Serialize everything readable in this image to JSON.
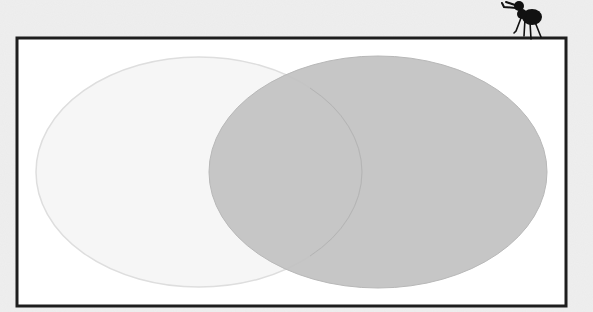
{
  "diagram": {
    "type": "venn",
    "background_color": "#efefef",
    "frame": {
      "x": 17,
      "y": 38,
      "width": 549,
      "height": 268,
      "stroke": "#1e1e1e",
      "stroke_width": 3,
      "fill": "#ffffff"
    },
    "sets": [
      {
        "id": "left",
        "cx": 199,
        "cy": 172,
        "rx": 163,
        "ry": 115,
        "fill": "#f6f6f6",
        "stroke": "#dedede",
        "opacity": 1
      },
      {
        "id": "right",
        "cx": 378,
        "cy": 172,
        "rx": 169,
        "ry": 116,
        "fill": "#c2c2c2",
        "stroke": "#b8b8b8",
        "opacity": 0.93
      }
    ],
    "decoration": {
      "name": "ant",
      "color": "#111111"
    }
  }
}
